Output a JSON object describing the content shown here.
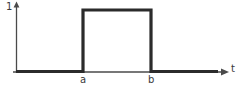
{
  "figure": {
    "background_color": "#ffffff",
    "width": 243,
    "height": 95
  },
  "labels": {
    "y_axis": "1",
    "x_axis": "t",
    "pulse_start": "a",
    "pulse_end": "b"
  },
  "chart_data": {
    "type": "line",
    "title": "",
    "subtitle": "",
    "xlabel": "t",
    "ylabel": "1",
    "grid": false,
    "legend": null,
    "axis_color": "#4a4a4a",
    "series_color": "#2b2b2b",
    "series": [
      {
        "name": "rectangular pulse",
        "x": [
          "0",
          "a",
          "a",
          "b",
          "b",
          "end"
        ],
        "values": [
          0,
          0,
          1,
          1,
          0,
          0
        ]
      }
    ],
    "x_tick_labels": [
      "a",
      "b"
    ],
    "x_tick_values": [
      83,
      151
    ],
    "y_tick_labels": [
      "1"
    ],
    "y_tick_values": [
      1
    ],
    "xlim": [
      0,
      243
    ],
    "ylim": [
      0,
      1.15
    ],
    "annotations": [
      {
        "text": "1",
        "role": "y-axis-amplitude-label"
      },
      {
        "text": "t",
        "role": "x-axis-variable-label"
      },
      {
        "text": "a",
        "role": "pulse-start-tick"
      },
      {
        "text": "b",
        "role": "pulse-end-tick"
      }
    ]
  },
  "geometry": {
    "y_axis_x": 16.5,
    "baseline_y": 72,
    "pulse_top_y": 10,
    "pulse_left_x": 83,
    "pulse_right_x": 151,
    "signal_start_x": 16,
    "signal_end_x": 218,
    "x_arrow_tip_x": 228,
    "y_arrow_tip_y": 2
  }
}
